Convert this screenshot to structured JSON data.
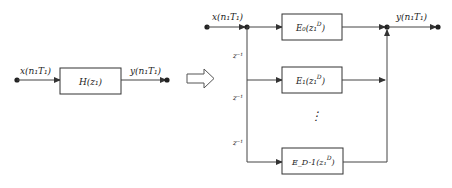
{
  "diagram": {
    "type": "block-diagram",
    "colors": {
      "line": "#444444",
      "text": "#222222",
      "background": "#ffffff"
    },
    "left": {
      "input_label": "x(n₁T₁)",
      "block_label": "H(z₁)",
      "output_label": "y(n₁T₁)"
    },
    "transform_arrow": "hollow-right-arrow",
    "right": {
      "input_label": "x(n₁T₁)",
      "output_label": "y(n₁T₁)",
      "delay_labels": [
        "z⁻¹",
        "z⁻¹",
        "z⁻¹"
      ],
      "ellipsis": "⋮",
      "blocks": [
        {
          "name": "E₀",
          "arg": "(z₁",
          "sup": "D",
          "close": ")"
        },
        {
          "name": "E₁",
          "arg": "(z₁",
          "sup": "D",
          "close": ")"
        },
        {
          "name": "E_D-1",
          "arg": "(z₁",
          "sup": "D",
          "close": ")"
        }
      ]
    }
  }
}
